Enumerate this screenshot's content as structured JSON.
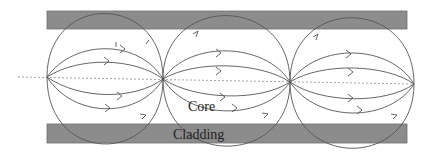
{
  "diagram": {
    "labels": {
      "core": "Core",
      "cladding": "Cladding",
      "ray_marker": "l"
    },
    "colors": {
      "cladding_fill": "#8c8c8c",
      "cladding_edge": "#6e6e6e",
      "ray_stroke": "#555555",
      "axis_stroke": "#999999",
      "background": "#ffffff"
    },
    "geometry": {
      "top_cladding": {
        "x": 47,
        "y": 11,
        "width": 360,
        "height": 18
      },
      "bottom_cladding": {
        "x": 47,
        "y": 124,
        "width": 360,
        "height": 19
      },
      "axis": {
        "x1": 18,
        "y1": 77,
        "x2": 414,
        "y2": 84
      },
      "nodes_x": [
        47,
        163,
        290,
        414
      ],
      "cells": 3
    }
  }
}
